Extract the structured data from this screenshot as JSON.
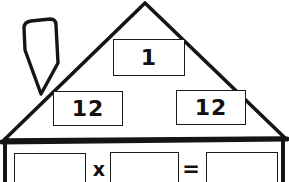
{
  "worksheet": {
    "title": "Fact Family House",
    "background_color": "#ffffff",
    "line_color": "#1a1a1a",
    "text_color": "#111111"
  },
  "house": {
    "chimney": {
      "name": "chimney"
    },
    "roof": {
      "name": "roof-triangle"
    },
    "eave": {
      "name": "eave-band"
    },
    "wall": {
      "name": "wall"
    }
  },
  "roof_boxes": [
    {
      "id": "top",
      "value": "1",
      "name": "roof-box-top"
    },
    {
      "id": "left",
      "value": "12",
      "name": "roof-box-left"
    },
    {
      "id": "right",
      "value": "12",
      "name": "roof-box-right"
    }
  ],
  "equation": {
    "operator_times": "x",
    "operator_equals": "=",
    "blanks": [
      {
        "id": "a",
        "value": ""
      },
      {
        "id": "b",
        "value": ""
      },
      {
        "id": "c",
        "value": ""
      }
    ]
  }
}
